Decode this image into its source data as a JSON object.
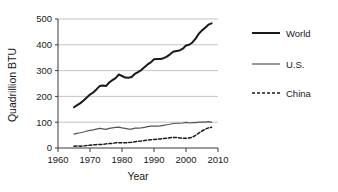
{
  "chart_data": {
    "type": "line",
    "title": "",
    "xlabel": "Year",
    "ylabel": "Quadrillion BTU",
    "xlim": [
      1960,
      2010
    ],
    "ylim": [
      0,
      500
    ],
    "xticks": [
      1960,
      1970,
      1980,
      1990,
      2000,
      2010
    ],
    "xtick_labels": [
      "1960",
      "1970",
      "1980",
      "1990",
      "2000",
      "2010"
    ],
    "yticks": [
      0,
      100,
      200,
      300,
      400,
      500
    ],
    "ytick_labels": [
      "0",
      "100",
      "200",
      "300",
      "400",
      "500"
    ],
    "grid": "horizontal",
    "legend_position": "right",
    "x": [
      1965,
      1966,
      1967,
      1968,
      1969,
      1970,
      1971,
      1972,
      1973,
      1974,
      1975,
      1976,
      1977,
      1978,
      1979,
      1980,
      1981,
      1982,
      1983,
      1984,
      1985,
      1986,
      1987,
      1988,
      1989,
      1990,
      1991,
      1992,
      1993,
      1994,
      1995,
      1996,
      1997,
      1998,
      1999,
      2000,
      2001,
      2002,
      2003,
      2004,
      2005,
      2006,
      2007,
      2008
    ],
    "series": [
      {
        "name": "World",
        "style": "solid-thick",
        "color": "#1a1a1a",
        "values": [
          158,
          166,
          174,
          184,
          196,
          207,
          215,
          227,
          240,
          242,
          240,
          254,
          263,
          271,
          285,
          279,
          273,
          272,
          275,
          287,
          294,
          302,
          313,
          324,
          332,
          344,
          345,
          345,
          348,
          354,
          363,
          373,
          376,
          378,
          385,
          397,
          400,
          409,
          424,
          443,
          456,
          466,
          478,
          483
        ]
      },
      {
        "name": "U.S.",
        "style": "solid-thin",
        "color": "#555555",
        "values": [
          54,
          57,
          59,
          62,
          66,
          68,
          70,
          73,
          76,
          74,
          72,
          76,
          78,
          80,
          81,
          78,
          76,
          73,
          73,
          77,
          77,
          78,
          80,
          83,
          85,
          85,
          85,
          86,
          88,
          90,
          92,
          95,
          96,
          96,
          97,
          99,
          97,
          98,
          98,
          100,
          100,
          100,
          102,
          99
        ]
      },
      {
        "name": "China",
        "style": "dashed",
        "color": "#1a1a1a",
        "values": [
          7,
          8,
          7,
          8,
          10,
          11,
          12,
          13,
          14,
          14,
          16,
          17,
          18,
          20,
          20,
          20,
          20,
          21,
          22,
          24,
          26,
          27,
          29,
          31,
          32,
          33,
          34,
          35,
          37,
          38,
          40,
          41,
          41,
          39,
          38,
          38,
          39,
          42,
          49,
          58,
          66,
          73,
          78,
          80
        ]
      }
    ]
  }
}
